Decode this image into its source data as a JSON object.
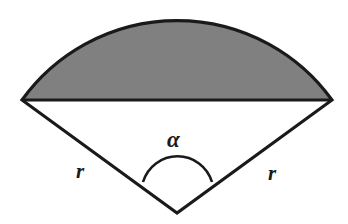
{
  "figure": {
    "type": "geometry-diagram",
    "background_color": "#ffffff",
    "stroke_color": "#1a1a1a",
    "segment_fill_color": "#808080",
    "sector_fill_color": "#ffffff",
    "stroke_width": 3.2,
    "geometry": {
      "center": {
        "x": 177,
        "y": 213
      },
      "radius": 191,
      "left_vertex": {
        "x": 22,
        "y": 100
      },
      "right_vertex": {
        "x": 332,
        "y": 100
      },
      "arc_apex": {
        "x": 177,
        "y": 15
      },
      "chord_y": 100,
      "angle_arc_radius": 36,
      "angle_arc_left": {
        "x": 143,
        "y": 182
      },
      "angle_arc_right": {
        "x": 212,
        "y": 182
      },
      "angle_arc_apex": {
        "x": 177,
        "y": 166
      }
    },
    "labels": {
      "angle": "α",
      "radius_left": "r",
      "radius_right": "r"
    }
  }
}
